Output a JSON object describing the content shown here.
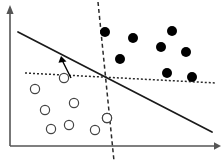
{
  "figure": {
    "type": "scatter-classification-diagram",
    "width": 221,
    "height": 166,
    "background": "#ffffff",
    "title": "",
    "caption": ""
  },
  "chart_data": {
    "type": "scatter",
    "title": "",
    "subtitle": "",
    "xlabel": "",
    "ylabel": "",
    "xlim": [
      0,
      221
    ],
    "ylim": [
      0,
      166
    ],
    "grid": false,
    "legend": "none",
    "axes": {
      "x_axis": {
        "name": "x-axis",
        "x1": 10,
        "y1": 146,
        "x2": 216,
        "y2": 146,
        "arrow_end": "right",
        "color": "#555555",
        "width": 1.6,
        "tick_labels": []
      },
      "y_axis": {
        "name": "y-axis",
        "x1": 10,
        "y1": 146,
        "x2": 10,
        "y2": 12,
        "arrow_end": "top",
        "color": "#555555",
        "width": 1.6,
        "tick_labels": []
      }
    },
    "series": [
      {
        "name": "class-positive",
        "marker": "filled-circle",
        "color": "#000000",
        "radius": 5.0,
        "count": 8,
        "points": [
          {
            "x": 105,
            "y": 32
          },
          {
            "x": 133,
            "y": 38
          },
          {
            "x": 120,
            "y": 59
          },
          {
            "x": 172,
            "y": 31
          },
          {
            "x": 161,
            "y": 47
          },
          {
            "x": 186,
            "y": 52
          },
          {
            "x": 167,
            "y": 73
          },
          {
            "x": 192,
            "y": 77
          }
        ]
      },
      {
        "name": "class-negative",
        "marker": "open-circle",
        "color": "#444444",
        "fill": "#ffffff",
        "radius": 4.6,
        "count": 9,
        "points": [
          {
            "x": 64,
            "y": 78
          },
          {
            "x": 35,
            "y": 89
          },
          {
            "x": 45,
            "y": 110
          },
          {
            "x": 74,
            "y": 103
          },
          {
            "x": 51,
            "y": 129
          },
          {
            "x": 69,
            "y": 125
          },
          {
            "x": 95,
            "y": 130
          },
          {
            "x": 107,
            "y": 118
          },
          {
            "x": 107,
            "y": 118
          }
        ]
      }
    ],
    "lines": [
      {
        "name": "solid-decision-boundary",
        "style": "solid",
        "color": "#1a1a1a",
        "width": 1.7,
        "x1": 18,
        "y1": 32,
        "x2": 212,
        "y2": 132
      },
      {
        "name": "dotted-slanted-boundary",
        "style": "dotted",
        "color": "#2a2a2a",
        "width": 1.5,
        "dash": "2,2",
        "x1": 25,
        "y1": 73,
        "x2": 216,
        "y2": 83
      },
      {
        "name": "dashed-vertical-boundary",
        "style": "dashed",
        "color": "#2a2a2a",
        "width": 1.5,
        "dash": "4,3",
        "x1": 98,
        "y1": 2,
        "x2": 114,
        "y2": 161
      }
    ],
    "annotations": [
      {
        "name": "margin-arrow",
        "type": "arrow",
        "color": "#000000",
        "width": 1.4,
        "x1": 71,
        "y1": 78,
        "x2": 61,
        "y2": 58,
        "label": ""
      }
    ],
    "intersection_point": {
      "x": 105,
      "y": 78
    }
  }
}
